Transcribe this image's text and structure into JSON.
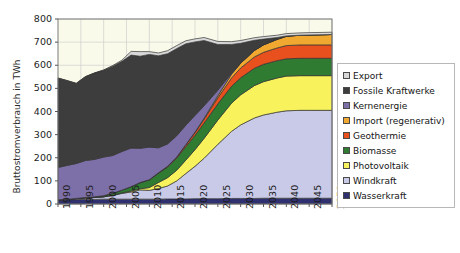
{
  "chart_data": {
    "type": "area",
    "stacked": true,
    "title": "",
    "xlabel": "",
    "ylabel": "Bruttostromverbrauch in TWh",
    "xlim": [
      1990,
      2050
    ],
    "ylim": [
      0,
      800
    ],
    "ytick_values": [
      0,
      100,
      200,
      300,
      400,
      500,
      600,
      700,
      800
    ],
    "xtick_values": [
      1990,
      1995,
      2000,
      2005,
      2010,
      2015,
      2020,
      2025,
      2030,
      2035,
      2040,
      2045,
      2050
    ],
    "xtick_labels": [
      "1990",
      "1995",
      "2000",
      "2005",
      "2010",
      "2015",
      "2020",
      "2025",
      "2030",
      "2035",
      "2040",
      "2045",
      "2050"
    ],
    "ytick_labels": [
      "0",
      "100",
      "200",
      "300",
      "400",
      "500",
      "600",
      "700",
      "800"
    ],
    "grid": true,
    "legend_position": "right",
    "plot_background": "#FAFAEA",
    "x": [
      1990,
      1992,
      1994,
      1996,
      1998,
      2000,
      2002,
      2004,
      2006,
      2008,
      2010,
      2012,
      2014,
      2016,
      2018,
      2020,
      2022,
      2025,
      2028,
      2030,
      2033,
      2035,
      2038,
      2040,
      2043,
      2045,
      2048,
      2050
    ],
    "series": [
      {
        "name": "Wasserkraft",
        "color": "#2E3070",
        "values": [
          17,
          18,
          19,
          20,
          20,
          21,
          21,
          21,
          21,
          21,
          21,
          21,
          22,
          22,
          22,
          23,
          23,
          23,
          24,
          24,
          24,
          25,
          25,
          25,
          25,
          25,
          25,
          25
        ]
      },
      {
        "name": "Windkraft",
        "color": "#C8CAE8",
        "values": [
          1,
          2,
          4,
          6,
          8,
          10,
          16,
          25,
          31,
          40,
          38,
          46,
          56,
          78,
          110,
          140,
          175,
          235,
          290,
          318,
          348,
          360,
          372,
          378,
          380,
          380,
          380,
          380
        ]
      },
      {
        "name": "Photovoltaik",
        "color": "#F8F25C",
        "values": [
          0,
          0,
          0,
          0,
          0,
          0,
          1,
          2,
          4,
          5,
          12,
          26,
          36,
          46,
          58,
          72,
          86,
          105,
          122,
          130,
          140,
          144,
          148,
          150,
          150,
          150,
          150,
          150
        ]
      },
      {
        "name": "Biomasse",
        "color": "#2F7B32",
        "values": [
          0,
          0,
          1,
          2,
          3,
          5,
          8,
          12,
          19,
          26,
          33,
          40,
          46,
          52,
          58,
          62,
          66,
          70,
          73,
          74,
          75,
          75,
          75,
          75,
          75,
          75,
          75,
          75
        ]
      },
      {
        "name": "Geothermie",
        "color": "#E8501E",
        "values": [
          0,
          0,
          0,
          0,
          0,
          0,
          0,
          0,
          0,
          1,
          1,
          2,
          3,
          5,
          8,
          12,
          17,
          26,
          36,
          42,
          49,
          52,
          55,
          57,
          58,
          58,
          58,
          58
        ]
      },
      {
        "name": "Import (regenerativ)",
        "color": "#F0A830",
        "values": [
          0,
          0,
          0,
          0,
          0,
          0,
          0,
          0,
          0,
          0,
          0,
          0,
          0,
          0,
          1,
          2,
          4,
          9,
          16,
          21,
          28,
          32,
          37,
          40,
          42,
          43,
          44,
          45
        ]
      },
      {
        "name": "Kernenergie",
        "color": "#7D6FA8",
        "values": [
          140,
          147,
          151,
          160,
          162,
          167,
          164,
          167,
          167,
          148,
          141,
          108,
          97,
          92,
          84,
          72,
          54,
          24,
          4,
          0,
          0,
          0,
          0,
          0,
          0,
          0,
          0,
          0
        ]
      },
      {
        "name": "Fossile Kraftwerke",
        "color": "#3D3D3D",
        "values": [
          386,
          366,
          346,
          362,
          373,
          375,
          386,
          390,
          402,
          398,
          401,
          398,
          390,
          377,
          352,
          318,
          282,
          198,
          125,
          86,
          44,
          25,
          8,
          2,
          0,
          0,
          0,
          0
        ]
      },
      {
        "name": "Export",
        "color": "#D8D8D8",
        "values": [
          1,
          1,
          1,
          1,
          1,
          2,
          3,
          5,
          16,
          20,
          12,
          12,
          13,
          13,
          13,
          13,
          13,
          13,
          12,
          12,
          11,
          11,
          10,
          10,
          10,
          10,
          10,
          10
        ]
      }
    ]
  },
  "legend": {
    "items": [
      {
        "label": "Export",
        "color": "#D8D8D8"
      },
      {
        "label": "Fossile Kraftwerke",
        "color": "#3D3D3D"
      },
      {
        "label": "Kernenergie",
        "color": "#7D6FA8"
      },
      {
        "label": "Import (regenerativ)",
        "color": "#F0A830"
      },
      {
        "label": "Geothermie",
        "color": "#E8501E"
      },
      {
        "label": "Biomasse",
        "color": "#2F7B32"
      },
      {
        "label": "Photovoltaik",
        "color": "#F8F25C"
      },
      {
        "label": "Windkraft",
        "color": "#C8CAE8"
      },
      {
        "label": "Wasserkraft",
        "color": "#2E3070"
      }
    ]
  },
  "axis": {
    "y_title": "Bruttostromverbrauch in TWh"
  }
}
